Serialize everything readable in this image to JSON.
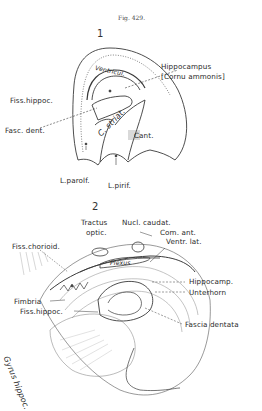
{
  "figure": {
    "caption": "Fig. 429.",
    "panels": [
      {
        "number": "1",
        "labels": {
          "hippocampus": "Hippocampus",
          "cornu_ammonis": "[Cornu ammonis]",
          "ventricle": "Ventricul.",
          "fiss_hippoc": "Fiss.hippoc.",
          "fasc_dent": "Fasc. dent.",
          "c_striat": "C. striat.",
          "cant": "Cant.",
          "l_parolf": "L.parolf.",
          "l_pirif": "L.pirif."
        }
      },
      {
        "number": "2",
        "labels": {
          "tractus": "Tractus",
          "optic": "optic.",
          "nucl_caudat": "Nucl. caudat.",
          "com_ant": "Com. ant.",
          "ventr_lat": "Ventr. lat.",
          "fiss_chorioid": "Fiss.chorioid.",
          "plexus": "Plexus",
          "hippocamp": "Hippocamp.",
          "unterhorn": "Unterhorn",
          "fimbria": "Fimbria",
          "fiss_hippoc": "Fiss.hippoc.",
          "fascia_dentata": "Fascia dentata",
          "gyrus_hippoc": "Gyrus hippoc."
        }
      }
    ]
  }
}
